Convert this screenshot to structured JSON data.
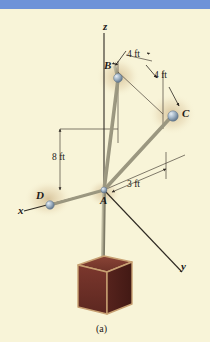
{
  "figure": {
    "caption": "(a)",
    "background_color": "#f8f4d8",
    "top_bar_color": "#6e93d8",
    "cable_color": "#a8a48c",
    "node_color": "#9fb2c4",
    "block_face_color": "#6b2e27",
    "block_edge_color": "#c8a173",
    "axis_color": "#3a342c",
    "type": "free-body diagram / 3D statics figure"
  },
  "axes": [
    {
      "name": "x-axis-label",
      "label": "x"
    },
    {
      "name": "y-axis-label",
      "label": "y"
    },
    {
      "name": "z-axis-label",
      "label": "z"
    }
  ],
  "nodes": [
    {
      "name": "point-a",
      "label": "A"
    },
    {
      "name": "point-b",
      "label": "B"
    },
    {
      "name": "point-c",
      "label": "C"
    },
    {
      "name": "point-d",
      "label": "D"
    }
  ],
  "dimensions": [
    {
      "name": "dim-b-horizontal",
      "label": "4 ft"
    },
    {
      "name": "dim-c-depth",
      "label": "4 ft"
    },
    {
      "name": "dim-height-ab",
      "label": "8 ft"
    },
    {
      "name": "dim-a-to-c-base",
      "label": "3 ft"
    }
  ]
}
